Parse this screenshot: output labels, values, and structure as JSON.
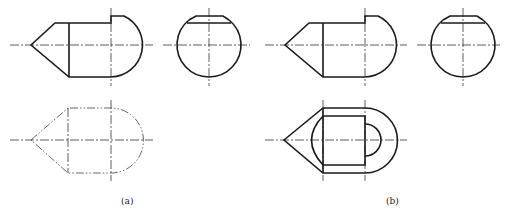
{
  "figure": {
    "panels": [
      {
        "id": "a",
        "label": "(a)",
        "views": [
          "front-view",
          "side-view",
          "top-view-phantom"
        ]
      },
      {
        "id": "b",
        "label": "(b)",
        "views": [
          "front-view",
          "side-view",
          "top-view"
        ]
      }
    ]
  },
  "colors": {
    "line": "#1a1a1a",
    "centerline": "#333333",
    "phantom": "#555555",
    "background": "#ffffff"
  }
}
